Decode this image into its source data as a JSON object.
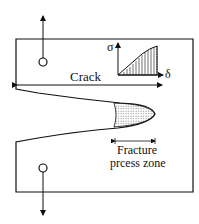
{
  "diagram": {
    "crack_label": "Crack",
    "zone_label_line1": "Fracture",
    "zone_label_line2": "prcess zone",
    "sigma_label": "σ",
    "delta_label": "δ",
    "colors": {
      "line": "#111111",
      "background": "#ffffff"
    }
  }
}
